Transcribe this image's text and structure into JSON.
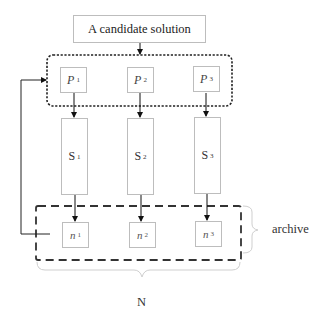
{
  "diagram": {
    "title_box": {
      "label": "A candidate solution"
    },
    "population_group": {
      "style": "dotted-rounded",
      "items": [
        {
          "symbol": "P",
          "subscript": "1"
        },
        {
          "symbol": "P",
          "subscript": "2"
        },
        {
          "symbol": "P",
          "subscript": "3"
        }
      ]
    },
    "search_group": {
      "items": [
        {
          "symbol": "S",
          "subscript": "1"
        },
        {
          "symbol": "S",
          "subscript": "2"
        },
        {
          "symbol": "S",
          "subscript": "3"
        }
      ]
    },
    "archive_group": {
      "style": "dashed",
      "label": "archive",
      "items": [
        {
          "symbol": "n",
          "subscript": "1"
        },
        {
          "symbol": "n",
          "subscript": "2"
        },
        {
          "symbol": "n",
          "subscript": "3"
        }
      ]
    },
    "bottom_brace_label": "N",
    "colors": {
      "box_border": "#bdbdbd",
      "line": "#222222",
      "brace": "#cccccc"
    }
  }
}
